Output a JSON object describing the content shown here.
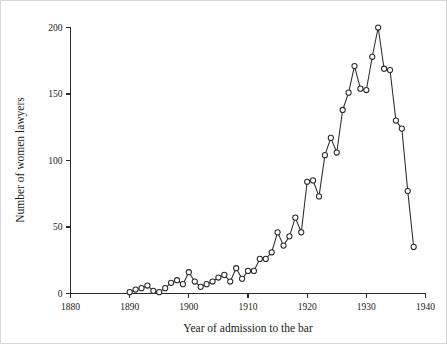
{
  "chart_data": {
    "type": "line",
    "title": "",
    "xlabel": "Year of admission to the bar",
    "ylabel": "Number of women lawyers",
    "xlim": [
      1880,
      1940
    ],
    "ylim": [
      0,
      200
    ],
    "xticks": [
      1880,
      1890,
      1900,
      1910,
      1920,
      1930,
      1940
    ],
    "xticklabels": [
      "1880",
      "1890",
      "1900",
      "1910",
      "1920",
      "1930",
      "1940"
    ],
    "yticks": [
      0,
      50,
      100,
      150,
      200
    ],
    "yticklabels": [
      "0",
      "50",
      "100",
      "150",
      "200"
    ],
    "grid": false,
    "legend": null,
    "marker": "open-circle",
    "line_color": "#2b2b2b",
    "marker_face_color": "#ffffff",
    "x": [
      1890,
      1891,
      1892,
      1893,
      1894,
      1895,
      1896,
      1897,
      1898,
      1899,
      1900,
      1901,
      1902,
      1903,
      1904,
      1905,
      1906,
      1907,
      1908,
      1909,
      1910,
      1911,
      1912,
      1913,
      1914,
      1915,
      1916,
      1917,
      1918,
      1919,
      1920,
      1921,
      1922,
      1923,
      1924,
      1925,
      1926,
      1927,
      1928,
      1929,
      1930,
      1931,
      1932,
      1933,
      1934,
      1935,
      1936,
      1937,
      1938
    ],
    "y": [
      1,
      3,
      4,
      6,
      2,
      1,
      4,
      8,
      10,
      7,
      16,
      9,
      5,
      7,
      9,
      12,
      14,
      9,
      19,
      11,
      17,
      17,
      26,
      26,
      31,
      46,
      36,
      43,
      57,
      46,
      84,
      85,
      73,
      104,
      117,
      106,
      138,
      151,
      171,
      154,
      153,
      178,
      200,
      169,
      168,
      130,
      124,
      77,
      35
    ],
    "series": [
      {
        "name": "Women lawyers admitted",
        "values": [
          1,
          3,
          4,
          6,
          2,
          1,
          4,
          8,
          10,
          7,
          16,
          9,
          5,
          7,
          9,
          12,
          14,
          9,
          19,
          11,
          17,
          17,
          26,
          26,
          31,
          46,
          36,
          43,
          57,
          46,
          84,
          85,
          73,
          104,
          117,
          106,
          138,
          151,
          171,
          154,
          153,
          178,
          200,
          169,
          168,
          130,
          124,
          77,
          35
        ]
      }
    ],
    "n_points": 49,
    "peak": {
      "x": 1932,
      "y": 200
    },
    "first_point": {
      "x": 1890,
      "y": 1
    },
    "last_point": {
      "x": 1938,
      "y": 35
    }
  }
}
